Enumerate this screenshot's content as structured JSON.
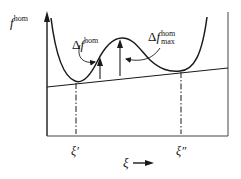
{
  "diagram": {
    "y_axis_label": {
      "symbol": "f",
      "superscript": "hom"
    },
    "delta_f_label": {
      "prefix": "Δ",
      "symbol": "f",
      "superscript": "hom"
    },
    "delta_f_max_label": {
      "prefix": "Δ",
      "symbol": "f",
      "superscript": "hom",
      "subscript": "max"
    },
    "x_ticks": [
      {
        "label": "ξ′"
      },
      {
        "label": "ξ″"
      }
    ],
    "x_axis_label": "ξ",
    "x_axis_arrow": "→",
    "colors": {
      "line": "#1a1a1a",
      "background": "#ffffff"
    }
  }
}
